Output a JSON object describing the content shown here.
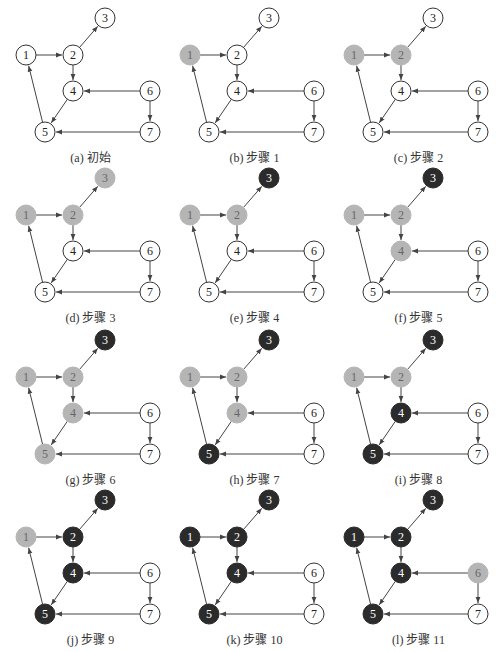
{
  "figure": {
    "colors": {
      "unvisited_fill": "#ffffff",
      "visiting_fill": "#b5b5b5",
      "finished_fill": "#2b2b2b",
      "stroke": "#333333",
      "edge": "#444444"
    },
    "nodes": [
      {
        "id": "1",
        "x": 18,
        "y": 55
      },
      {
        "id": "2",
        "x": 65,
        "y": 55
      },
      {
        "id": "3",
        "x": 97,
        "y": 18
      },
      {
        "id": "4",
        "x": 65,
        "y": 91
      },
      {
        "id": "5",
        "x": 37,
        "y": 132
      },
      {
        "id": "6",
        "x": 142,
        "y": 91
      },
      {
        "id": "7",
        "x": 142,
        "y": 132
      }
    ],
    "edges": [
      {
        "from": "1",
        "to": "2"
      },
      {
        "from": "2",
        "to": "3"
      },
      {
        "from": "2",
        "to": "4"
      },
      {
        "from": "4",
        "to": "5"
      },
      {
        "from": "5",
        "to": "1"
      },
      {
        "from": "6",
        "to": "4"
      },
      {
        "from": "6",
        "to": "7"
      },
      {
        "from": "7",
        "to": "5"
      }
    ],
    "panels": [
      {
        "caption": "(a) 初始",
        "ox": 8,
        "oy": 0,
        "states": {
          "1": "w",
          "2": "w",
          "3": "w",
          "4": "w",
          "5": "w",
          "6": "w",
          "7": "w"
        }
      },
      {
        "caption": "(b) 步骤 1",
        "ox": 172,
        "oy": 0,
        "states": {
          "1": "g",
          "2": "w",
          "3": "w",
          "4": "w",
          "5": "w",
          "6": "w",
          "7": "w"
        }
      },
      {
        "caption": "(c) 步骤 2",
        "ox": 336,
        "oy": 0,
        "states": {
          "1": "g",
          "2": "g",
          "3": "w",
          "4": "w",
          "5": "w",
          "6": "w",
          "7": "w"
        }
      },
      {
        "caption": "(d) 步骤 3",
        "ox": 8,
        "oy": 160,
        "states": {
          "1": "g",
          "2": "g",
          "3": "g",
          "4": "w",
          "5": "w",
          "6": "w",
          "7": "w"
        }
      },
      {
        "caption": "(e) 步骤 4",
        "ox": 172,
        "oy": 160,
        "states": {
          "1": "g",
          "2": "g",
          "3": "b",
          "4": "w",
          "5": "w",
          "6": "w",
          "7": "w"
        }
      },
      {
        "caption": "(f) 步骤 5",
        "ox": 336,
        "oy": 160,
        "states": {
          "1": "g",
          "2": "g",
          "3": "b",
          "4": "g",
          "5": "w",
          "6": "w",
          "7": "w"
        }
      },
      {
        "caption": "(g) 步骤 6",
        "ox": 8,
        "oy": 322,
        "states": {
          "1": "g",
          "2": "g",
          "3": "b",
          "4": "g",
          "5": "g",
          "6": "w",
          "7": "w"
        }
      },
      {
        "caption": "(h) 步骤 7",
        "ox": 172,
        "oy": 322,
        "states": {
          "1": "g",
          "2": "g",
          "3": "b",
          "4": "g",
          "5": "b",
          "6": "w",
          "7": "w"
        }
      },
      {
        "caption": "(i) 步骤 8",
        "ox": 336,
        "oy": 322,
        "states": {
          "1": "g",
          "2": "g",
          "3": "b",
          "4": "b",
          "5": "b",
          "6": "w",
          "7": "w"
        }
      },
      {
        "caption": "(j) 步骤 9",
        "ox": 8,
        "oy": 482,
        "states": {
          "1": "g",
          "2": "b",
          "3": "b",
          "4": "b",
          "5": "b",
          "6": "w",
          "7": "w"
        }
      },
      {
        "caption": "(k) 步骤 10",
        "ox": 172,
        "oy": 482,
        "states": {
          "1": "b",
          "2": "b",
          "3": "b",
          "4": "b",
          "5": "b",
          "6": "w",
          "7": "w"
        }
      },
      {
        "caption": "(l) 步骤 11",
        "ox": 336,
        "oy": 482,
        "states": {
          "1": "b",
          "2": "b",
          "3": "b",
          "4": "b",
          "5": "b",
          "6": "g",
          "7": "w"
        }
      }
    ]
  }
}
